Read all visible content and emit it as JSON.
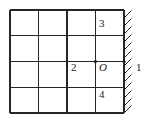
{
  "figure": {
    "type": "grid-diagram",
    "title": "",
    "background_color": "#ffffff",
    "line_color": "#262626",
    "text_color": "#1a1a1a"
  },
  "grid": {
    "columns": 4,
    "rows": 4,
    "left": 10,
    "top": 10,
    "right": 124,
    "bottom": 113,
    "cell_width": 28.5,
    "cell_height": 25.75,
    "vertical_line_x": [
      10,
      38.5,
      67,
      95.5,
      124
    ],
    "horizontal_line_y": [
      10,
      35.75,
      61.5,
      87.25,
      113
    ]
  },
  "wall": {
    "name": "hatched-wall",
    "side": "right",
    "x": 124,
    "top": 10,
    "bottom": 113,
    "hatch_direction": "up-right",
    "hatch_count": 13,
    "hatch_length": 9
  },
  "labels": [
    {
      "id": "label-3",
      "text": "3",
      "style": "upright",
      "column": 4,
      "row": 1
    },
    {
      "id": "label-2",
      "text": "2",
      "style": "upright",
      "column": 3,
      "row": 3
    },
    {
      "id": "label-O",
      "text": "O",
      "style": "italic",
      "column": 4,
      "row": 3
    },
    {
      "id": "label-4",
      "text": "4",
      "style": "upright",
      "column": 4,
      "row": 4
    },
    {
      "id": "label-1",
      "text": "1",
      "style": "upright",
      "column": "outside-right",
      "row": 3
    }
  ],
  "marked_points": [
    {
      "name": "origin-point",
      "x": 95.5,
      "y": 61.5
    },
    {
      "name": "wall-contact-point",
      "x": 124,
      "y": 61.5
    }
  ]
}
